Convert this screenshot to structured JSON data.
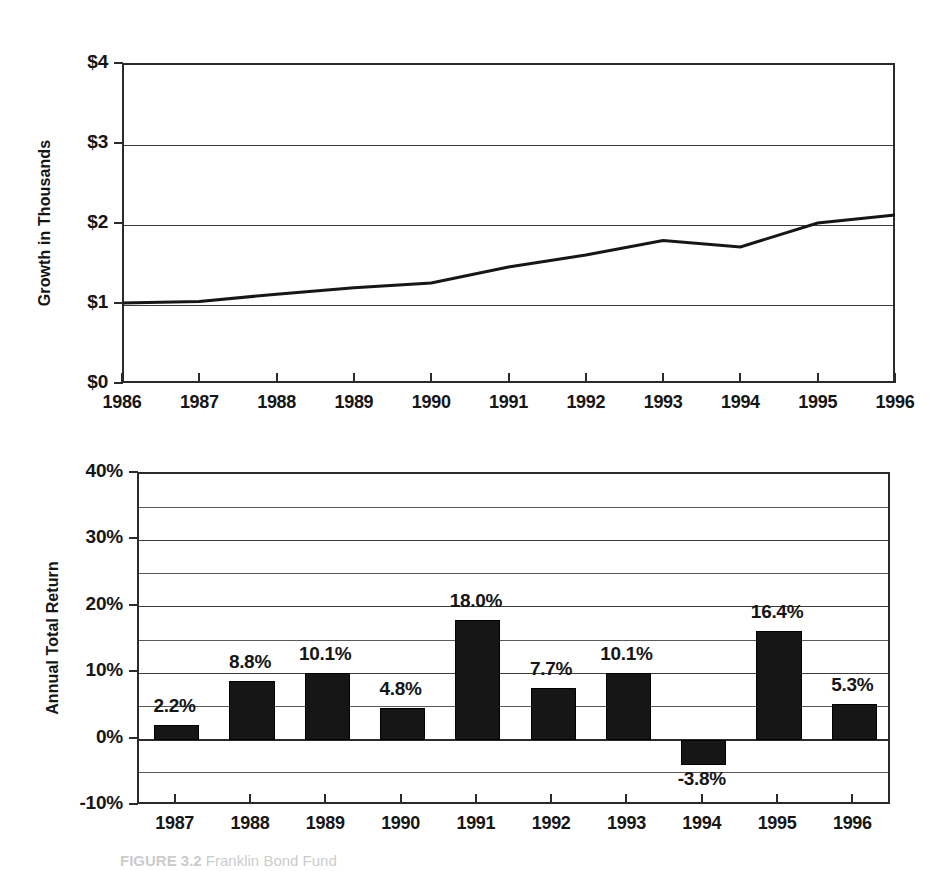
{
  "figure": {
    "caption_label": "FIGURE 3.2",
    "caption_text": "Franklin Bond Fund"
  },
  "chart_data": [
    {
      "id": "growth",
      "type": "line",
      "title": "",
      "xlabel": "",
      "ylabel": "Growth in Thousands",
      "x": [
        1986,
        1987,
        1988,
        1989,
        1990,
        1991,
        1992,
        1993,
        1994,
        1995,
        1996
      ],
      "values": [
        1.0,
        1.02,
        1.11,
        1.19,
        1.25,
        1.45,
        1.6,
        1.78,
        1.7,
        2.0,
        2.1
      ],
      "categories": [
        "1986",
        "1987",
        "1988",
        "1989",
        "1990",
        "1991",
        "1992",
        "1993",
        "1994",
        "1995",
        "1996"
      ],
      "ylim": [
        0,
        4
      ],
      "ytick_values": [
        4,
        3,
        2,
        1,
        0
      ],
      "ytick_labels": [
        "$4",
        "$3",
        "$2",
        "$1",
        "$0"
      ],
      "grid": true,
      "legend": "none",
      "line_color": "#161616"
    },
    {
      "id": "annual-total-return",
      "type": "bar",
      "title": "",
      "xlabel": "",
      "ylabel": "Annual Total Return",
      "categories": [
        "1987",
        "1988",
        "1989",
        "1990",
        "1991",
        "1992",
        "1993",
        "1994",
        "1995",
        "1996"
      ],
      "values": [
        2.2,
        8.8,
        10.1,
        4.8,
        18.0,
        7.7,
        10.1,
        -3.8,
        16.4,
        5.3
      ],
      "data_labels": [
        "2.2%",
        "8.8%",
        "10.1%",
        "4.8%",
        "18.0%",
        "7.7%",
        "10.1%",
        "-3.8%",
        "16.4%",
        "5.3%"
      ],
      "ylim": [
        -10,
        40
      ],
      "ytick_values": [
        40,
        30,
        20,
        10,
        0,
        -10
      ],
      "ytick_labels": [
        "40%",
        "30%",
        "20%",
        "10%",
        "0%",
        "-10%"
      ],
      "minor_gridline_values": [
        35,
        25,
        15,
        5,
        -5
      ],
      "grid": true,
      "legend": "none",
      "bar_color": "#161616"
    }
  ]
}
